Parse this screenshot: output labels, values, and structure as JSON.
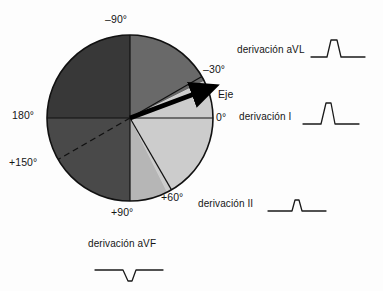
{
  "figure": {
    "kind": "hexaxial-reference-diagram",
    "language": "es",
    "background_color": "#fdfdfd",
    "line_color": "#111111"
  },
  "circle": {
    "center_x": 130,
    "center_y": 118,
    "radius": 83,
    "outline_color": "#111111"
  },
  "sectors": [
    {
      "name": "upper-left-quadrant",
      "from_deg": -90,
      "to_deg": -180,
      "fill": "#3c3c3c",
      "label": "superior izquierdo"
    },
    {
      "name": "lower-left-quadrant",
      "from_deg": 90,
      "to_deg": 180,
      "fill": "#4d4d4d",
      "label": "inferior izquierdo"
    },
    {
      "name": "normal-axis-sector",
      "from_deg": -30,
      "to_deg": 90,
      "fill": "#d5d5d5",
      "label": "eje normal"
    },
    {
      "name": "upper-right-sector",
      "from_deg": -90,
      "to_deg": -30,
      "fill": "#6f6f6f",
      "label": "superior derecho"
    },
    {
      "name": "lower-right-wedge",
      "from_deg": 60,
      "to_deg": 90,
      "fill": "#bdbdbd",
      "label": "cuña +60 a +90"
    }
  ],
  "axes_lines": [
    {
      "name": "horizontal-axis",
      "angle_deg": 0,
      "style": "solid"
    },
    {
      "name": "vertical-axis",
      "angle_deg": -90,
      "style": "solid"
    },
    {
      "name": "minus30-line",
      "angle_deg": -30,
      "style": "solid"
    },
    {
      "name": "plus60-line",
      "angle_deg": 60,
      "style": "solid"
    },
    {
      "name": "plus150-line",
      "angle_deg": 150,
      "style": "dashed"
    }
  ],
  "axis_vector": {
    "name": "eje-electrico",
    "angle_deg": -20,
    "length_fraction": 0.95,
    "color": "#000000",
    "label": "Eje"
  },
  "degree_labels": {
    "minus_90": "–90°",
    "minus_30": "–30°",
    "zero": "0°",
    "one_eighty": "180°",
    "plus_150": "+150°",
    "plus_90": "+90°",
    "plus_60": "+60°"
  },
  "leads": [
    {
      "id": "avl",
      "label": "derivación aVL",
      "polarity": "positive",
      "deflection": "upright, moderate amplitude, narrow",
      "amplitude": 0.72,
      "width": 0.18
    },
    {
      "id": "i",
      "label": "derivación I",
      "polarity": "positive",
      "deflection": "upright, tall, narrow",
      "amplitude": 0.95,
      "width": 0.14
    },
    {
      "id": "ii",
      "label": "derivación II",
      "polarity": "positive",
      "deflection": "upright, small, narrow",
      "amplitude": 0.35,
      "width": 0.1
    },
    {
      "id": "avf",
      "label": "derivación aVF",
      "polarity": "negative",
      "deflection": "downward, small, narrow",
      "amplitude": -0.4,
      "width": 0.12
    }
  ]
}
